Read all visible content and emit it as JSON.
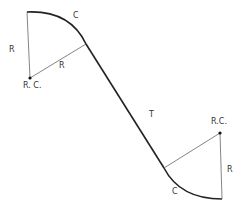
{
  "diagram": {
    "labels": {
      "curve_top": "C",
      "radius_top_vertical": "R",
      "radius_top_diagonal": "R",
      "center_top": "R. C.",
      "tangent": "T",
      "center_bottom": "R.C.",
      "radius_bottom_vertical": "R",
      "curve_bottom": "C"
    },
    "colors": {
      "curve": "#222222",
      "radius": "#555555",
      "point": "#111111"
    }
  }
}
